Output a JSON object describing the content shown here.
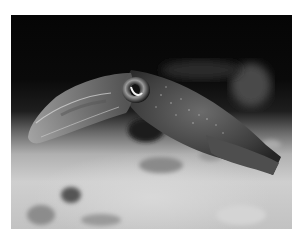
{
  "image": {
    "subject": "squid swimming above sandy seafloor",
    "alt": "Grayscale photograph of a squid with a large eye swimming over a sandy, pebbly sea bottom against a dark background",
    "colors": {
      "background_water": "#050505",
      "seafloor": "#c8c8c8",
      "body": "#5a5a5a",
      "frame": "#ffffff"
    }
  }
}
